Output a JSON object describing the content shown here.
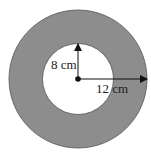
{
  "diagram": {
    "type": "annulus",
    "outer_radius_label": "12 cm",
    "inner_radius_label": "8 cm",
    "colors": {
      "ring_fill": "#8d8d8d",
      "ring_stroke": "#555555",
      "inner_fill": "#ffffff",
      "arrow": "#111111"
    }
  }
}
